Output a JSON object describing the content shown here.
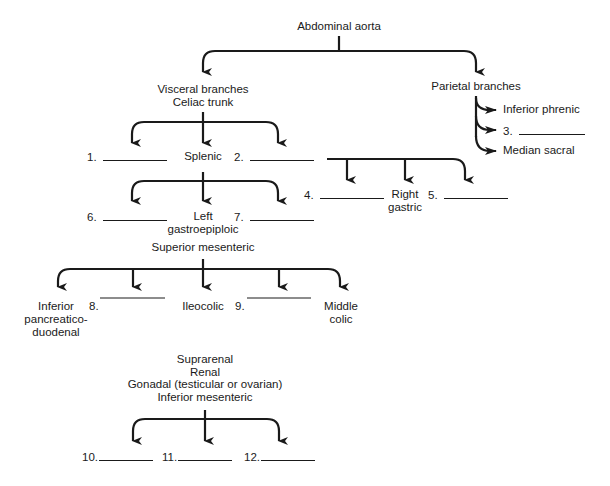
{
  "root": {
    "label": "Abdominal aorta"
  },
  "visceral": {
    "label_line1": "Visceral branches",
    "label_line2": "Celiac trunk",
    "celiac_branches": [
      {
        "label": "1.",
        "blank": true
      },
      {
        "label": "Splenic"
      },
      {
        "label": "2.",
        "blank": true
      }
    ],
    "splenic_branches": [
      {
        "label": "6.",
        "blank": true
      },
      {
        "label_line1": "Left",
        "label_line2": "gastroepiploic"
      },
      {
        "label": "7.",
        "blank": true
      }
    ],
    "hepatic_branches": [
      {
        "label": "4.",
        "blank": true
      },
      {
        "label_line1": "Right",
        "label_line2": "gastric"
      },
      {
        "label": "5.",
        "blank": true
      }
    ],
    "superior_mesenteric": {
      "label": "Superior mesenteric",
      "branches": [
        {
          "label_line1": "Inferior",
          "label_line2": "pancreatico-",
          "label_line3": "duodenal"
        },
        {
          "label": "8.",
          "blank": true
        },
        {
          "label": "Ileocolic"
        },
        {
          "label": "9.",
          "blank": true
        },
        {
          "label_line1": "Middle",
          "label_line2": "colic"
        }
      ]
    },
    "other": {
      "line1": "Suprarenal",
      "line2": "Renal",
      "line3": "Gonadal (testicular or ovarian)",
      "line4": "Inferior mesenteric",
      "branches": [
        {
          "label": "10.",
          "blank": true
        },
        {
          "label": "11.",
          "blank": true
        },
        {
          "label": "12.",
          "blank": true
        }
      ]
    }
  },
  "parietal": {
    "label": "Parietal branches",
    "branches": [
      {
        "label": "Inferior phrenic"
      },
      {
        "label": "3.",
        "blank": true
      },
      {
        "label": "Median sacral"
      }
    ]
  }
}
